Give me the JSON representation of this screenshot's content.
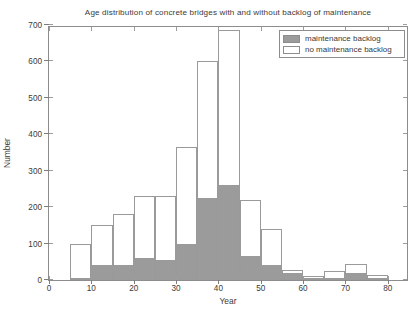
{
  "chart_data": {
    "type": "bar",
    "subtype": "stacked-histogram",
    "title": "Age distribution of concrete bridges with and without backlog of maintenance",
    "xlabel": "Year",
    "ylabel": "Number",
    "xlim": [
      0,
      85
    ],
    "ylim": [
      0,
      700
    ],
    "bin_width": 5,
    "grid": false,
    "legend_position": "top-right",
    "xticks": [
      0,
      10,
      20,
      30,
      40,
      50,
      60,
      70,
      80
    ],
    "xtick_labels": [
      "0",
      "10",
      "20",
      "30",
      "40",
      "50",
      "60",
      "70",
      "80"
    ],
    "yticks": [
      0,
      100,
      200,
      300,
      400,
      500,
      600,
      700
    ],
    "ytick_labels": [
      "0",
      "100",
      "200",
      "300",
      "400",
      "500",
      "600",
      "700"
    ],
    "bin_starts": [
      0,
      5,
      10,
      15,
      20,
      25,
      30,
      35,
      40,
      45,
      50,
      55,
      60,
      65,
      70,
      75
    ],
    "bin_labels": [
      "0-5",
      "5-10",
      "10-15",
      "15-20",
      "20-25",
      "25-30",
      "30-35",
      "35-40",
      "40-45",
      "45-50",
      "50-55",
      "55-60",
      "60-65",
      "65-70",
      "70-75",
      "75-80"
    ],
    "series": [
      {
        "name": "maintenance backlog",
        "color": "#9b9b9b",
        "values": [
          0,
          2,
          40,
          40,
          60,
          55,
          100,
          225,
          260,
          65,
          40,
          20,
          5,
          3,
          20,
          5
        ]
      },
      {
        "name": "no maintenance backlog",
        "color": "#ffffff",
        "values": [
          0,
          98,
          110,
          140,
          170,
          175,
          265,
          375,
          427,
          155,
          100,
          8,
          7,
          22,
          25,
          10
        ]
      }
    ],
    "totals": [
      0,
      100,
      150,
      180,
      230,
      230,
      365,
      600,
      687,
      220,
      140,
      28,
      12,
      25,
      45,
      15
    ]
  },
  "legend": {
    "entries": [
      {
        "label": "maintenance backlog",
        "swatch": "filled-gray"
      },
      {
        "label": "no maintenance backlog",
        "swatch": "empty-white"
      }
    ]
  },
  "caption": {
    "text": ""
  }
}
